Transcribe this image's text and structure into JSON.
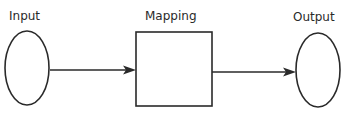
{
  "diagram": {
    "type": "flow",
    "colors": {
      "stroke": "#2a2a2a",
      "background": "#ffffff"
    },
    "nodes": [
      {
        "id": "input",
        "label": "Input",
        "shape": "ellipse",
        "cx": 27,
        "cy": 68,
        "rx": 22,
        "ry": 37,
        "label_x": 9,
        "label_y": 20
      },
      {
        "id": "mapping",
        "label": "Mapping",
        "shape": "rectangle",
        "x": 136,
        "y": 32,
        "width": 76,
        "height": 74,
        "label_x": 145,
        "label_y": 20
      },
      {
        "id": "output",
        "label": "Output",
        "shape": "ellipse",
        "cx": 318,
        "cy": 70,
        "rx": 22,
        "ry": 37,
        "label_x": 293,
        "label_y": 21
      }
    ],
    "edges": [
      {
        "from": "input",
        "to": "mapping",
        "x1": 50,
        "y1": 70,
        "x2": 136,
        "y2": 70
      },
      {
        "from": "mapping",
        "to": "output",
        "x1": 212,
        "y1": 72,
        "x2": 296,
        "y2": 72
      }
    ]
  }
}
